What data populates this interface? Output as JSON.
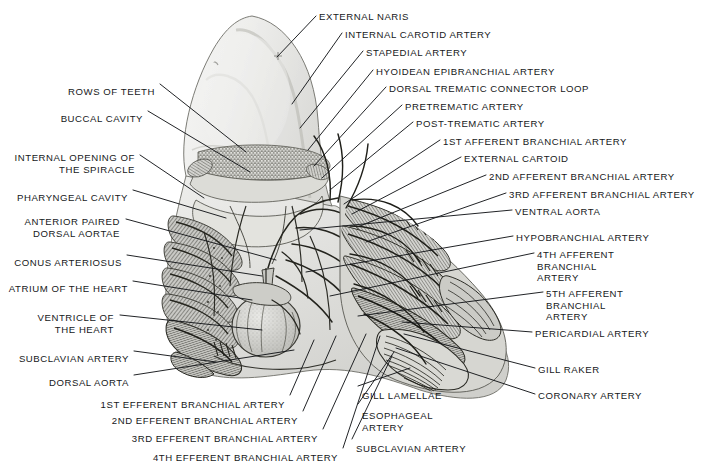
{
  "figure": {
    "width": 711,
    "height": 463,
    "background_color": "#ffffff",
    "ink_color": "#16181a",
    "label_count": 31
  },
  "labels_left": [
    {
      "id": "rows-of-teeth",
      "text": "ROWS OF TEETH",
      "x": 155,
      "y": 86,
      "align": "right",
      "lines": [
        "ROWS OF TEETH"
      ]
    },
    {
      "id": "buccal-cavity",
      "text": "BUCCAL CAVITY",
      "x": 143,
      "y": 113,
      "align": "right",
      "lines": [
        "BUCCAL CAVITY"
      ]
    },
    {
      "id": "internal-opening-spiracle",
      "text": "INTERNAL OPENING OF THE SPIRACLE",
      "x": 135,
      "y": 152,
      "align": "right",
      "lines": [
        "INTERNAL OPENING OF",
        "THE SPIRACLE"
      ]
    },
    {
      "id": "pharyngeal-cavity",
      "text": "PHARYNGEAL CAVITY",
      "x": 128,
      "y": 192,
      "align": "right",
      "lines": [
        "PHARYNGEAL CAVITY"
      ]
    },
    {
      "id": "anterior-paired-dorsal-aortae",
      "text": "ANTERIOR PAIRED DORSAL AORTAE",
      "x": 120,
      "y": 216,
      "align": "right",
      "lines": [
        "ANTERIOR PAIRED",
        "DORSAL AORTAE"
      ]
    },
    {
      "id": "conus-arteriosus",
      "text": "CONUS ARTERIOSUS",
      "x": 122,
      "y": 257,
      "align": "right",
      "lines": [
        "CONUS ARTERIOSUS"
      ]
    },
    {
      "id": "atrium-of-the-heart",
      "text": "ATRIUM OF THE HEART",
      "x": 128,
      "y": 283,
      "align": "right",
      "lines": [
        "ATRIUM OF THE HEART"
      ]
    },
    {
      "id": "ventricle-of-the-heart",
      "text": "VENTRICLE OF THE HEART",
      "x": 114,
      "y": 312,
      "align": "right",
      "lines": [
        "VENTRICLE OF",
        "THE HEART"
      ]
    },
    {
      "id": "subclavian-artery-left",
      "text": "SUBCLAVIAN ARTERY",
      "x": 129,
      "y": 353,
      "align": "right",
      "lines": [
        "SUBCLAVIAN ARTERY"
      ]
    },
    {
      "id": "dorsal-aorta",
      "text": "DORSAL AORTA",
      "x": 129,
      "y": 377,
      "align": "right",
      "lines": [
        "DORSAL AORTA"
      ]
    },
    {
      "id": "1st-efferent-branchial-artery",
      "text": "1ST EFFERENT BRANCHIAL ARTERY",
      "x": 285,
      "y": 399,
      "align": "right",
      "lines": [
        "1ST EFFERENT BRANCHIAL ARTERY"
      ]
    },
    {
      "id": "2nd-efferent-branchial-artery",
      "text": "2ND EFFERENT BRANCHIAL ARTERY",
      "x": 298,
      "y": 415,
      "align": "right",
      "lines": [
        "2ND EFFERENT BRANCHIAL ARTERY"
      ]
    },
    {
      "id": "3rd-efferent-branchial-artery",
      "text": "3RD EFFERENT BRANCHIAL ARTERY",
      "x": 318,
      "y": 433,
      "align": "right",
      "lines": [
        "3RD EFFERENT BRANCHIAL ARTERY"
      ]
    },
    {
      "id": "4th-efferent-branchial-artery",
      "text": "4TH EFFERENT BRANCHIAL ARTERY",
      "x": 338,
      "y": 452,
      "align": "right",
      "lines": [
        "4TH EFFERENT BRANCHIAL ARTERY"
      ]
    }
  ],
  "labels_bottom_center": [
    {
      "id": "gill-lamellae",
      "text": "GILL LAMELLAE",
      "x": 362,
      "y": 390,
      "align": "left",
      "lines": [
        "GILL LAMELLAE"
      ]
    },
    {
      "id": "esophageal-artery",
      "text": "ESOPHAGEAL ARTERY",
      "x": 362,
      "y": 410,
      "align": "left",
      "lines": [
        "ESOPHAGEAL",
        "ARTERY"
      ]
    },
    {
      "id": "subclavian-artery-bottom",
      "text": "SUBCLAVIAN ARTERY",
      "x": 356,
      "y": 443,
      "align": "left",
      "lines": [
        "SUBCLAVIAN ARTERY"
      ]
    }
  ],
  "labels_right": [
    {
      "id": "external-naris",
      "text": "EXTERNAL NARIS",
      "x": 319,
      "y": 11,
      "align": "left",
      "lines": [
        "EXTERNAL NARIS"
      ]
    },
    {
      "id": "internal-carotid-artery",
      "text": "INTERNAL CAROTID ARTERY",
      "x": 345,
      "y": 29,
      "align": "left",
      "lines": [
        "INTERNAL CAROTID ARTERY"
      ]
    },
    {
      "id": "stapedial-artery",
      "text": "STAPEDIAL ARTERY",
      "x": 366,
      "y": 47,
      "align": "left",
      "lines": [
        "STAPEDIAL ARTERY"
      ]
    },
    {
      "id": "hyoidean-epibranchial-artery",
      "text": "HYOIDEAN EPIBRANCHIAL ARTERY",
      "x": 376,
      "y": 66,
      "align": "left",
      "lines": [
        "HYOIDEAN EPIBRANCHIAL ARTERY"
      ]
    },
    {
      "id": "dorsal-trematic-connector-loop",
      "text": "DORSAL TREMATIC CONNECTOR LOOP",
      "x": 389,
      "y": 83,
      "align": "left",
      "lines": [
        "DORSAL TREMATIC CONNECTOR LOOP"
      ]
    },
    {
      "id": "pretrematic-artery",
      "text": "PRETREMATIC ARTERY",
      "x": 405,
      "y": 101,
      "align": "left",
      "lines": [
        "PRETREMATIC ARTERY"
      ]
    },
    {
      "id": "post-trematic-artery",
      "text": "POST-TREMATIC ARTERY",
      "x": 416,
      "y": 118,
      "align": "left",
      "lines": [
        "POST-TREMATIC ARTERY"
      ]
    },
    {
      "id": "1st-afferent-branchial-artery",
      "text": "1ST AFFERENT BRANCHIAL ARTERY",
      "x": 443,
      "y": 136,
      "align": "left",
      "lines": [
        "1ST AFFERENT BRANCHIAL ARTERY"
      ]
    },
    {
      "id": "external-cartoid",
      "text": "EXTERNAL CARTOID",
      "x": 464,
      "y": 153,
      "align": "left",
      "lines": [
        "EXTERNAL CARTOID"
      ]
    },
    {
      "id": "2nd-afferent-branchial-artery",
      "text": "2ND AFFERENT BRANCHIAL ARTERY",
      "x": 489,
      "y": 171,
      "align": "left",
      "lines": [
        "2ND AFFERENT BRANCHIAL ARTERY"
      ]
    },
    {
      "id": "3rd-afferent-branchial-artery",
      "text": "3RD AFFERENT BRANCHIAL ARTERY",
      "x": 509,
      "y": 189,
      "align": "left",
      "lines": [
        "3RD AFFERENT BRANCHIAL ARTERY"
      ]
    },
    {
      "id": "ventral-aorta",
      "text": "VENTRAL AORTA",
      "x": 515,
      "y": 206,
      "align": "left",
      "lines": [
        "VENTRAL AORTA"
      ]
    },
    {
      "id": "hypobranchial-artery",
      "text": "HYPOBRANCHIAL ARTERY",
      "x": 516,
      "y": 232,
      "align": "left",
      "lines": [
        "HYPOBRANCHIAL ARTERY"
      ]
    },
    {
      "id": "4th-afferent-branchial-artery",
      "text": "4TH AFFERENT BRANCHIAL ARTERY",
      "x": 537,
      "y": 249,
      "align": "left",
      "lines": [
        "4TH AFFERENT",
        "BRANCHIAL",
        "ARTERY"
      ]
    },
    {
      "id": "5th-afferent-branchial-artery",
      "text": "5TH AFFERENT BRANCHIAL ARTERY",
      "x": 546,
      "y": 288,
      "align": "left",
      "lines": [
        "5TH AFFERENT",
        "BRANCHIAL",
        "ARTERY"
      ]
    },
    {
      "id": "pericardial-artery",
      "text": "PERICARDIAL ARTERY",
      "x": 535,
      "y": 328,
      "align": "left",
      "lines": [
        "PERICARDIAL ARTERY"
      ]
    },
    {
      "id": "gill-raker",
      "text": "GILL RAKER",
      "x": 538,
      "y": 364,
      "align": "left",
      "lines": [
        "GILL RAKER"
      ]
    },
    {
      "id": "coronary-artery",
      "text": "CORONARY ARTERY",
      "x": 538,
      "y": 390,
      "align": "left",
      "lines": [
        "CORONARY ARTERY"
      ]
    }
  ]
}
